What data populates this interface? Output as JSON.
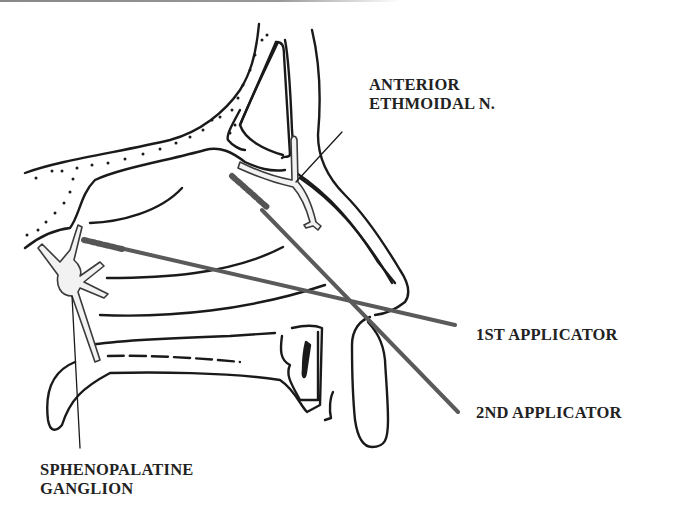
{
  "diagram": {
    "type": "anatomical-illustration",
    "labels": {
      "anterior_ethmoidal": {
        "line1": "ANTERIOR",
        "line2": "ETHMOIDAL N."
      },
      "first_applicator": "1ST APPLICATOR",
      "second_applicator": "2ND APPLICATOR",
      "sphenopalatine": {
        "line1": "SPHENOPALATINE",
        "line2": "GANGLION"
      }
    },
    "colors": {
      "ink": "#1a1a1a",
      "applicator": "#5a5a5a",
      "nerve_fill": "#f2f2f2",
      "background": "#ffffff"
    }
  }
}
